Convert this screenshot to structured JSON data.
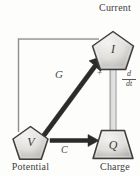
{
  "diagram": {
    "type": "tetrahedron-of-state",
    "nodes": [
      {
        "id": "current",
        "symbol": "I",
        "caption": "Current",
        "shape": "pentagon"
      },
      {
        "id": "potential",
        "symbol": "V",
        "caption": "Potential",
        "shape": "pentagon"
      },
      {
        "id": "charge",
        "symbol": "Q",
        "caption": "Charge",
        "shape": "trapezoid"
      }
    ],
    "edges": [
      {
        "id": "conductance",
        "label": "G",
        "from": "potential",
        "to": "current",
        "style": "thick-black-arrow"
      },
      {
        "id": "capacitance",
        "label": "C",
        "from": "potential",
        "to": "charge",
        "style": "thick-black-arrow"
      },
      {
        "id": "derivative",
        "label": "d/dt",
        "numerator": "d",
        "denominator": "dt",
        "from": "charge",
        "to": "current",
        "style": "hollow-gray-arrow"
      },
      {
        "id": "feedback",
        "label": "",
        "from": "current",
        "to": "potential",
        "style": "thin-gray-line"
      }
    ],
    "annotations": [
      {
        "id": "summing-plus",
        "text": "+"
      }
    ],
    "colors": {
      "background": "#fdfdfc",
      "node_outline": "#3d3d3d",
      "node_fill_light": "#f0efed",
      "node_fill_dark": "#b9b7b4",
      "arrow_black": "#262626",
      "arrow_gray": "#9a9a9a",
      "thin_line": "#8e8e8e",
      "text": "#3a3a3a"
    }
  }
}
